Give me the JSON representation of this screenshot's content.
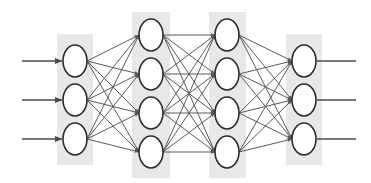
{
  "diagram": {
    "title": "Feedforward neural network architecture diagram",
    "type": "neural-network",
    "canvas": {
      "width": 371,
      "height": 183
    },
    "background_color": "#ffffff",
    "style": {
      "panel_fill": "#e8e8e8",
      "node_fill": "#ffffff",
      "node_stroke": "#2b2b2b",
      "node_stroke_width": 1.6,
      "connection_color": "#5a5a5a",
      "connection_width": 1.0,
      "io_line_color": "#4a4a4a",
      "io_line_width": 1.4,
      "node_rx": 12,
      "node_ry": 16
    },
    "layers": [
      {
        "name": "input-layer",
        "label": "Input layer",
        "index": 0,
        "node_count": 3,
        "center_x": 75,
        "panel": {
          "x": 57,
          "y": 34,
          "width": 36,
          "height": 131
        },
        "node_centers_y": [
          61,
          100,
          139
        ]
      },
      {
        "name": "hidden-layer-1",
        "label": "Hidden layer 1",
        "index": 1,
        "node_count": 4,
        "center_x": 151,
        "panel": {
          "x": 132,
          "y": 12,
          "width": 38,
          "height": 166
        },
        "node_centers_y": [
          35,
          74,
          113,
          152
        ]
      },
      {
        "name": "hidden-layer-2",
        "label": "Hidden layer 2",
        "index": 2,
        "node_count": 4,
        "center_x": 227,
        "panel": {
          "x": 209,
          "y": 12,
          "width": 37,
          "height": 166
        },
        "node_centers_y": [
          35,
          74,
          113,
          152
        ]
      },
      {
        "name": "output-layer",
        "label": "Output layer",
        "index": 3,
        "node_count": 3,
        "center_x": 304,
        "panel": {
          "x": 286,
          "y": 34,
          "width": 36,
          "height": 131
        },
        "node_centers_y": [
          61,
          100,
          139
        ]
      }
    ],
    "connections": [
      {
        "from_layer": 0,
        "to_layer": 1,
        "fully_connected": true,
        "count": 12
      },
      {
        "from_layer": 1,
        "to_layer": 2,
        "fully_connected": true,
        "count": 16
      },
      {
        "from_layer": 2,
        "to_layer": 3,
        "fully_connected": true,
        "count": 12
      }
    ],
    "input_arrows": {
      "name": "input-arrows",
      "count": 3,
      "x_start": 22,
      "x_end": 62,
      "y_positions": [
        61,
        100,
        139
      ],
      "arrowhead": true
    },
    "output_arrows": {
      "name": "output-arrows",
      "count": 3,
      "x_start": 317,
      "x_end": 356,
      "y_positions": [
        61,
        100,
        139
      ],
      "arrowhead": false
    }
  }
}
